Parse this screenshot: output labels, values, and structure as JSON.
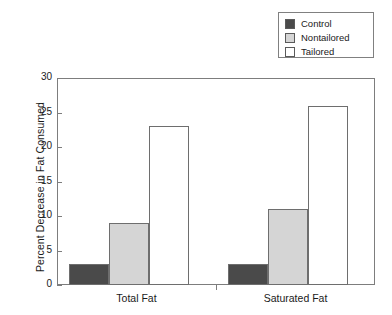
{
  "chart_data": {
    "type": "bar",
    "title": "",
    "xlabel": "",
    "ylabel": "Percent Decrease in Fat Consumed",
    "categories": [
      "Total Fat",
      "Saturated Fat"
    ],
    "series": [
      {
        "name": "Control",
        "values": [
          3,
          3
        ],
        "color": "#4a4a4a"
      },
      {
        "name": "Nontailored",
        "values": [
          9,
          11
        ],
        "color": "#d5d5d5"
      },
      {
        "name": "Tailored",
        "values": [
          23,
          26
        ],
        "color": "#ffffff"
      }
    ],
    "ylim": [
      0,
      30
    ],
    "yticks": [
      0,
      5,
      10,
      15,
      20,
      25,
      30
    ],
    "grid": false,
    "legend_position": "top-right"
  },
  "legend": {
    "items": [
      {
        "label": "Control",
        "swatch": "#4a4a4a"
      },
      {
        "label": "Nontailored",
        "swatch": "#d5d5d5"
      },
      {
        "label": "Tailored",
        "swatch": "#ffffff"
      }
    ]
  },
  "axes": {
    "y_title": "Percent Decrease in Fat Consumed",
    "y_ticklabels": [
      "30",
      "25",
      "20",
      "15",
      "10",
      "5",
      "0"
    ],
    "x_ticklabels": [
      "Total Fat",
      "Saturated Fat"
    ]
  }
}
